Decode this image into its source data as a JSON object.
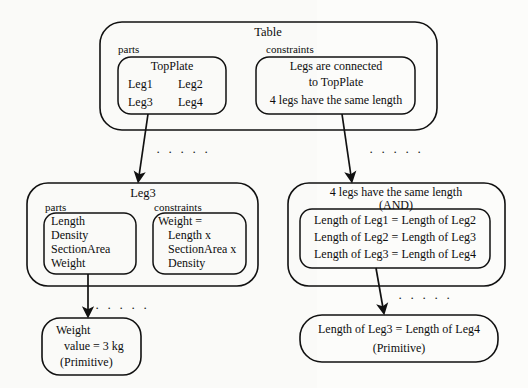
{
  "diagram": {
    "title_note": "Hierarchical decomposition of a Table design object",
    "dots_glyph": "· · · · ·",
    "nodes": {
      "table": {
        "title": "Table",
        "parts_label": "parts",
        "constraints_label": "constraints",
        "parts_items": [
          "TopPlate",
          "Leg1",
          "Leg2",
          "Leg3",
          "Leg4"
        ],
        "parts_line1": "TopPlate",
        "parts_line2a": "Leg1",
        "parts_line2b": "Leg2",
        "parts_line3a": "Leg3",
        "parts_line3b": "Leg4",
        "constraints_line1": "Legs are connected",
        "constraints_line2": "to TopPlate",
        "constraints_line3": "4 legs have the same length"
      },
      "leg3": {
        "title": "Leg3",
        "parts_label": "parts",
        "constraints_label": "constraints",
        "parts_line1": "Length",
        "parts_line2": "Density",
        "parts_line3": "SectionArea",
        "parts_line4": "Weight",
        "constraints_line1": "Weight =",
        "constraints_line2": "Length x",
        "constraints_line3": "SectionArea x",
        "constraints_line4": "Density"
      },
      "four_legs": {
        "title_line1": "4 legs have the same length",
        "title_line2": "(AND)",
        "constraint_line1": "Length of Leg1 = Length of Leg2",
        "constraint_line2": "Length of Leg2 = Length of Leg3",
        "constraint_line3": "Length of Leg3 = Length of Leg4"
      },
      "weight_primitive": {
        "line1": "Weight",
        "line2": "value = 3 kg",
        "line3": "(Primitive)"
      },
      "length_primitive": {
        "line1": "Length of Leg3 = Length of Leg4",
        "line2": "(Primitive)"
      }
    },
    "colors": {
      "stroke": "#111111",
      "text": "#0d0d0d",
      "background": "#fdfdfb"
    }
  }
}
